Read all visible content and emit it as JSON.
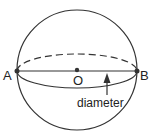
{
  "diagram": {
    "labels": {
      "point_a": "A",
      "point_b": "B",
      "center": "O",
      "diameter": "diameter"
    },
    "colors": {
      "stroke": "#333333",
      "background": "#ffffff"
    }
  }
}
